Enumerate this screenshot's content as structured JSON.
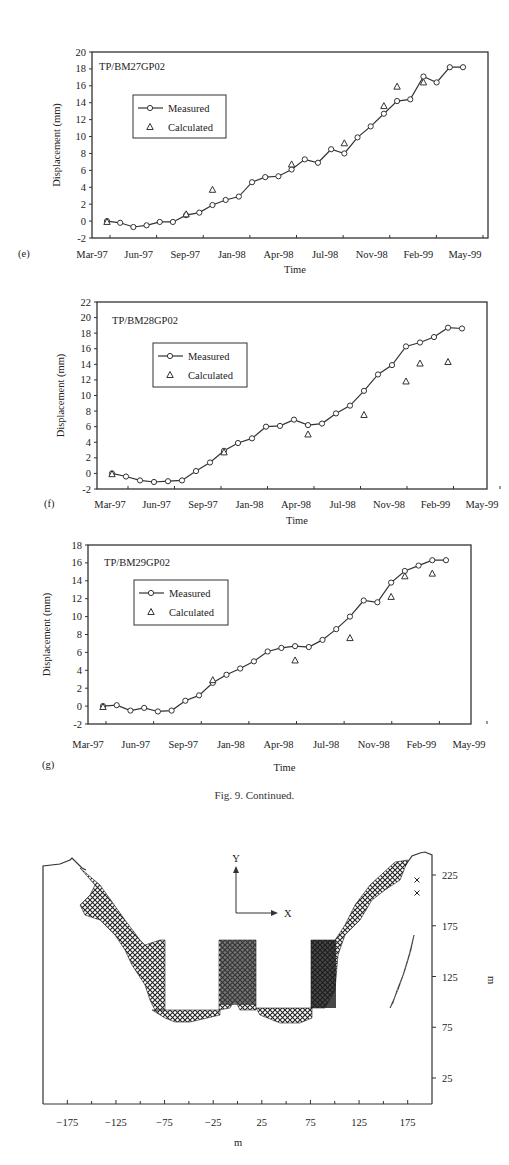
{
  "caption": "Fig. 9.  Continued.",
  "chart_data": [
    {
      "panel": "(e)",
      "type": "line",
      "title": "TP/BM27GP02",
      "xlabel": "Time",
      "ylabel": "Displacement (mm)",
      "ylim": [
        -2,
        20
      ],
      "yticks": [
        -2,
        0,
        2,
        4,
        6,
        8,
        10,
        12,
        14,
        16,
        18,
        20
      ],
      "xticks": [
        "Mar-97",
        "Jun-97",
        "Sep-97",
        "Jan-98",
        "Apr-98",
        "Jul-98",
        "Nov-98",
        "Feb-99",
        "May-99"
      ],
      "legend": [
        "Measured",
        "Calculated"
      ],
      "legend_position": "upper-left",
      "series": [
        {
          "name": "Measured",
          "marker": "circle",
          "line": true,
          "x": [
            0,
            0.9,
            2.0,
            2.8,
            4.0,
            4.7,
            5.9,
            6.9,
            7.5,
            8.5,
            9.5,
            10.4,
            11.4,
            12.3,
            13.3,
            14.2,
            15.3,
            16.2,
            17.5,
            18.7,
            19.6,
            20.4,
            21.4,
            22.2,
            23.1,
            24.0,
            25.0,
            26.0
          ],
          "y": [
            0,
            -0.2,
            -0.7,
            -0.5,
            -0.1,
            -0.1,
            0.7,
            1.0,
            1.9,
            2.5,
            2.9,
            4.6,
            5.2,
            5.3,
            6.1,
            7.3,
            6.9,
            8.5,
            8.0,
            9.9,
            11.2,
            12.7,
            14.2,
            14.4,
            17.1,
            16.4,
            18.2,
            18.2
          ],
          "x_note": "months since Mar-97"
        },
        {
          "name": "Calculated",
          "marker": "triangle",
          "line": false,
          "x": [
            0,
            6.9,
            9.2,
            16.2,
            20.6,
            25.3,
            26.8,
            27.2
          ],
          "y": [
            -0.1,
            0.8,
            3.7,
            6.7,
            9.2,
            13.6,
            15.9,
            16.4
          ]
        }
      ]
    },
    {
      "panel": "(f)",
      "type": "line",
      "title": "TP/BM28GP02",
      "xlabel": "Time",
      "ylabel": "Displacement (mm)",
      "ylim": [
        -2,
        22
      ],
      "yticks": [
        -2,
        0,
        2,
        4,
        6,
        8,
        10,
        12,
        14,
        16,
        18,
        20,
        22
      ],
      "xticks": [
        "Mar-97",
        "Jun-97",
        "Sep-97",
        "Jan-98",
        "Apr-98",
        "Jul-98",
        "Nov-98",
        "Feb-99",
        "May-99"
      ],
      "legend": [
        "Measured",
        "Calculated"
      ],
      "legend_position": "upper-left",
      "series": [
        {
          "name": "Measured",
          "marker": "circle",
          "line": true,
          "y": [
            0,
            -0.4,
            -0.9,
            -1.1,
            -1.0,
            -0.9,
            0.3,
            1.4,
            2.9,
            3.9,
            4.5,
            6.0,
            6.1,
            6.9,
            6.2,
            6.4,
            7.7,
            8.7,
            10.6,
            12.7,
            13.9,
            16.3,
            16.8,
            17.5,
            18.7,
            18.6
          ]
        },
        {
          "name": "Calculated",
          "marker": "triangle",
          "line": false,
          "y": [
            -0.1,
            2.7,
            5.0,
            7.5,
            11.8,
            14.1,
            14.3
          ],
          "x_labels_approx": [
            "Mar-97",
            "Jan-98",
            "Jun-98",
            "Nov-98",
            "Feb-99",
            "Mar-99",
            "Apr-99"
          ]
        }
      ]
    },
    {
      "panel": "(g)",
      "type": "line",
      "title": "TP/BM29GP02",
      "xlabel": "Time",
      "ylabel": "Displacement (mm)",
      "ylim": [
        -2,
        18
      ],
      "yticks": [
        -2,
        0,
        2,
        4,
        6,
        8,
        10,
        12,
        14,
        16,
        18
      ],
      "xticks": [
        "Mar-97",
        "Jun-97",
        "Sep-97",
        "Jan-98",
        "Apr-98",
        "Jul-98",
        "Nov-98",
        "Feb-99",
        "May-99"
      ],
      "legend": [
        "Measured",
        "Calculated"
      ],
      "legend_position": "upper-left",
      "series": [
        {
          "name": "Measured",
          "marker": "circle",
          "line": true,
          "y": [
            0,
            0.1,
            -0.5,
            -0.2,
            -0.6,
            -0.5,
            0.6,
            1.2,
            2.6,
            3.5,
            4.2,
            5.0,
            6.1,
            6.5,
            6.7,
            6.6,
            7.4,
            8.6,
            10.0,
            11.8,
            11.6,
            13.8,
            15.1,
            15.7,
            16.3,
            16.3
          ]
        },
        {
          "name": "Calculated",
          "marker": "triangle",
          "line": false,
          "y": [
            -0.1,
            2.9,
            5.1,
            7.6,
            12.2,
            14.5,
            14.8
          ]
        }
      ]
    },
    {
      "panel": "(h)",
      "type": "scatter",
      "title": "",
      "xlabel": "m",
      "ylabel": "m",
      "xlim": [
        -200,
        200
      ],
      "ylim": [
        0,
        250
      ],
      "xticks": [
        -175,
        -125,
        -75,
        -25,
        25,
        75,
        125,
        175
      ],
      "yticks": [
        25,
        75,
        125,
        175,
        225
      ],
      "y_axis_position": "right",
      "annotations": [
        "Y",
        "X"
      ],
      "description": "Excavation cross-section with yield zones marked by x symbols: left slope band, two side pits (x from -90 to -75 and 75 to 100, y 90 to 160), central berm (x -15 to 20, y 90 to 160), pit floors at y≈85, right slope band and a separate inclined band near x 155-178."
    }
  ]
}
